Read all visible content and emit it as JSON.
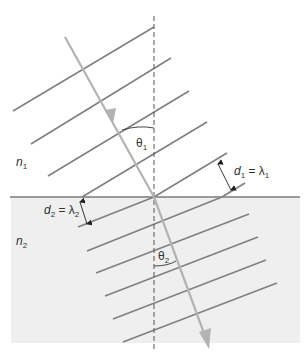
{
  "figure": {
    "type": "refraction-wavefront-diagram",
    "media": [
      {
        "id": "upper",
        "label_main": "n",
        "label_sub": "1",
        "background": "#ffffff"
      },
      {
        "id": "lower",
        "label_main": "n",
        "label_sub": "2",
        "background": "#efefef"
      }
    ],
    "angles": [
      {
        "label_main": "θ",
        "label_sub": "1"
      },
      {
        "label_main": "θ",
        "label_sub": "2"
      }
    ],
    "spacings": [
      {
        "d_main": "d",
        "d_sub": "1",
        "eq": " = ",
        "lambda_main": "λ",
        "lambda_sub": "1"
      },
      {
        "d_main": "d",
        "d_sub": "2",
        "eq": " = ",
        "lambda_main": "λ",
        "lambda_sub": "2"
      }
    ],
    "colors": {
      "wavefront": "#808080",
      "ray": "#b3b3b3",
      "interface": "#7a7a7a",
      "normal": "#555555",
      "annotation": "#222222",
      "lower_medium": "#efefef"
    }
  }
}
